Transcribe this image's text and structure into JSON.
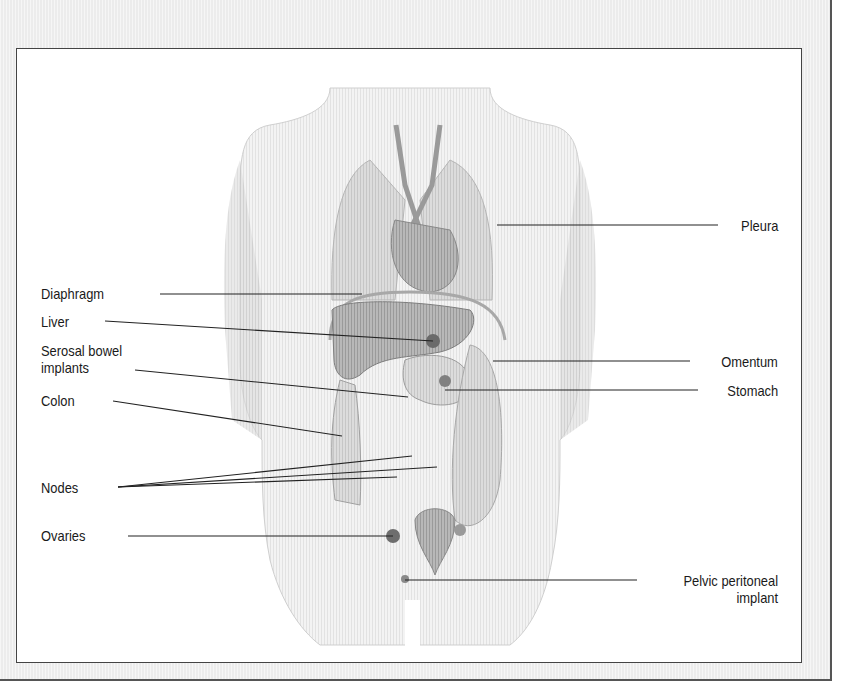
{
  "figure": {
    "type": "anatomical-diagram",
    "colors": {
      "frame_background": "#ececec",
      "frame_border": "#555555",
      "panel_background": "#ffffff",
      "label_text": "#1a1a1a",
      "leader_line": "#222222",
      "organ_tone": "#8c8c8c",
      "body_outline": "#bdbdbd"
    }
  },
  "labels": {
    "left": [
      {
        "id": "diaphragm",
        "text": "Diaphragm"
      },
      {
        "id": "liver",
        "text": "Liver"
      },
      {
        "id": "serosal",
        "text": "Serosal bowel\nimplants"
      },
      {
        "id": "colon",
        "text": "Colon"
      },
      {
        "id": "nodes",
        "text": "Nodes"
      },
      {
        "id": "ovaries",
        "text": "Ovaries"
      }
    ],
    "right": [
      {
        "id": "pleura",
        "text": "Pleura"
      },
      {
        "id": "omentum",
        "text": "Omentum"
      },
      {
        "id": "stomach",
        "text": "Stomach"
      },
      {
        "id": "pelvic",
        "text": "Pelvic peritoneal\nimplant"
      }
    ]
  }
}
